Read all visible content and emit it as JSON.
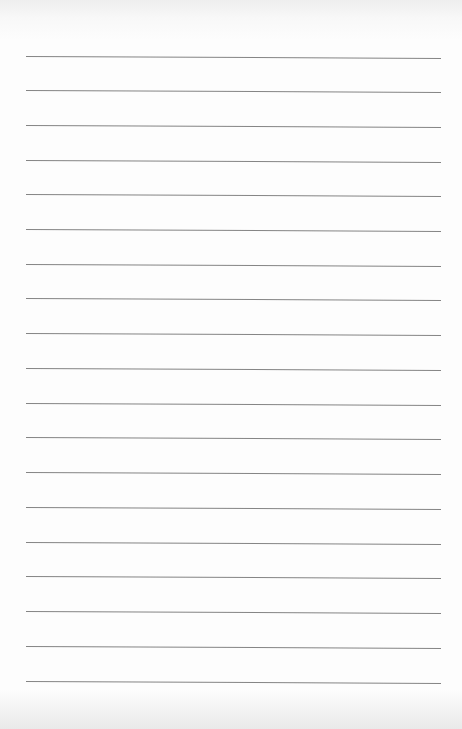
{
  "document": {
    "type": "lined-paper",
    "paper_color": "#fdfdfd",
    "line_color": "#6f6f6f",
    "line_count": 19,
    "lines": [
      {
        "index": 1,
        "y": 56
      },
      {
        "index": 2,
        "y": 90
      },
      {
        "index": 3,
        "y": 125
      },
      {
        "index": 4,
        "y": 160
      },
      {
        "index": 5,
        "y": 194
      },
      {
        "index": 6,
        "y": 229
      },
      {
        "index": 7,
        "y": 264
      },
      {
        "index": 8,
        "y": 298
      },
      {
        "index": 9,
        "y": 333
      },
      {
        "index": 10,
        "y": 368
      },
      {
        "index": 11,
        "y": 403
      },
      {
        "index": 12,
        "y": 437
      },
      {
        "index": 13,
        "y": 472
      },
      {
        "index": 14,
        "y": 507
      },
      {
        "index": 15,
        "y": 542
      },
      {
        "index": 16,
        "y": 576
      },
      {
        "index": 17,
        "y": 611
      },
      {
        "index": 18,
        "y": 646
      },
      {
        "index": 19,
        "y": 681
      }
    ],
    "text": ""
  }
}
